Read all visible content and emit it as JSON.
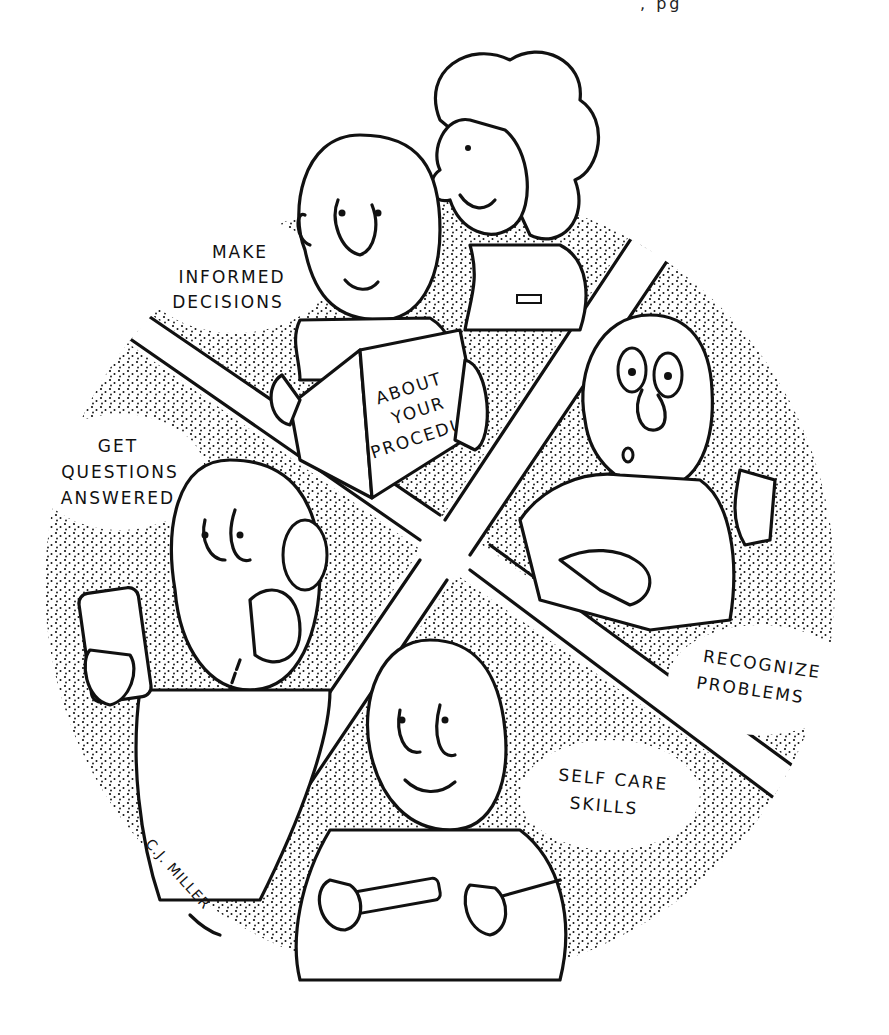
{
  "illustration": {
    "style": "pen-and-ink stipple cartoon",
    "colors": {
      "ink": "#111111",
      "paper": "#ffffff"
    },
    "top_fragment": ", pg",
    "quadrants": [
      {
        "position": "top",
        "label_lines": [
          "MAKE",
          "INFORMED",
          "DECISIONS"
        ],
        "scene": "man reading booklet with nurse"
      },
      {
        "position": "right",
        "label_lines": [
          "RECOGNIZE",
          "PROBLEMS"
        ],
        "scene": "surprised man pointing"
      },
      {
        "position": "bottom",
        "label_lines": [
          "SELF CARE",
          "SKILLS"
        ],
        "scene": "man squeezing toothpaste onto toothbrush"
      },
      {
        "position": "left",
        "label_lines": [
          "GET",
          "QUESTIONS",
          "ANSWERED"
        ],
        "scene": "man on telephone holding pill bottle"
      }
    ],
    "booklet": {
      "lines": [
        "ABOUT",
        "YOUR",
        "PROCEDURE"
      ]
    },
    "signature": "C.J. MILLER"
  }
}
